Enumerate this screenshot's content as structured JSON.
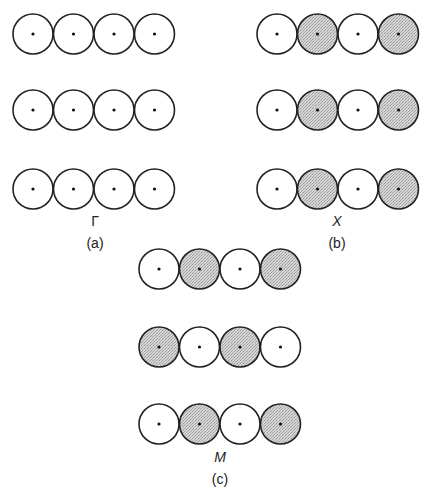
{
  "colors": {
    "outline": "#222222",
    "shaded": "#c8c8c8",
    "unshaded": "#ffffff",
    "dot": "#111111"
  },
  "panels": [
    {
      "id": "a",
      "symbol": "Γ",
      "caption": "(a)",
      "rows": [
        [
          "open",
          "open",
          "open",
          "open"
        ],
        [
          "open",
          "open",
          "open",
          "open"
        ],
        [
          "open",
          "open",
          "open",
          "open"
        ]
      ]
    },
    {
      "id": "b",
      "symbol": "X",
      "caption": "(b)",
      "rows": [
        [
          "open",
          "shaded",
          "open",
          "shaded"
        ],
        [
          "open",
          "shaded",
          "open",
          "shaded"
        ],
        [
          "open",
          "shaded",
          "open",
          "shaded"
        ]
      ]
    },
    {
      "id": "c",
      "symbol": "M",
      "caption": "(c)",
      "rows": [
        [
          "open",
          "shaded",
          "open",
          "shaded"
        ],
        [
          "shaded",
          "open",
          "shaded",
          "open"
        ],
        [
          "open",
          "shaded",
          "open",
          "shaded"
        ]
      ]
    }
  ]
}
